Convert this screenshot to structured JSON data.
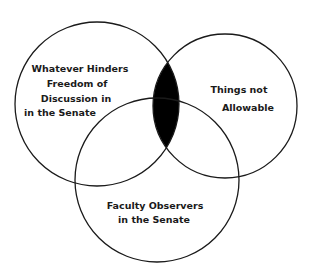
{
  "diagram": {
    "type": "venn",
    "sets": [
      {
        "id": "left",
        "label_lines": [
          "Whatever Hinders",
          "Freedom of",
          "Discussion in",
          "in the Senate"
        ]
      },
      {
        "id": "right",
        "label_lines": [
          "Things not",
          "Allowable"
        ]
      },
      {
        "id": "bottom",
        "label_lines": [
          "Faculty Observers",
          "in the Senate"
        ]
      }
    ],
    "highlighted_region": "left ∩ right (excluding nothing) — filled black",
    "colors": {
      "stroke": "#1a1a1a",
      "fill_highlight": "#000000",
      "background": "#ffffff"
    }
  }
}
